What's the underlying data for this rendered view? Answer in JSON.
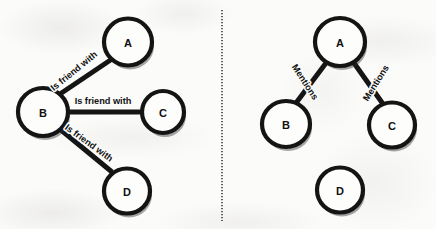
{
  "diagram": {
    "background_color": "#fbfbfa",
    "node_fill_color": "#fdfdfc",
    "stroke_color": "#141414",
    "divider": {
      "name": "panel-divider",
      "style": "vertical-dotted",
      "x": 222,
      "y_start": 10,
      "y_end": 221
    },
    "panels": [
      {
        "id": "left",
        "name": "friendship-graph",
        "edge_label_text": "Is friend with",
        "nodes": [
          {
            "id": "A",
            "label": "A",
            "cx": 128,
            "cy": 42,
            "r": 24
          },
          {
            "id": "B",
            "label": "B",
            "cx": 43,
            "cy": 112,
            "r": 25
          },
          {
            "id": "C",
            "label": "C",
            "cx": 163,
            "cy": 112,
            "r": 21
          },
          {
            "id": "D",
            "label": "D",
            "cx": 127,
            "cy": 191,
            "r": 23
          }
        ],
        "edges": [
          {
            "from": "B",
            "to": "A",
            "label": "Is friend with",
            "label_x": 74,
            "label_y": 71,
            "label_rotation": -39
          },
          {
            "from": "B",
            "to": "C",
            "label": "Is friend with",
            "label_x": 103,
            "label_y": 101,
            "label_rotation": 0
          },
          {
            "from": "B",
            "to": "D",
            "label": "Is friend with",
            "label_x": 89,
            "label_y": 143,
            "label_rotation": 36
          }
        ]
      },
      {
        "id": "right",
        "name": "mentions-graph",
        "edge_label_text": "Mentions",
        "nodes": [
          {
            "id": "A",
            "label": "A",
            "cx": 340,
            "cy": 42,
            "r": 25
          },
          {
            "id": "B",
            "label": "B",
            "cx": 286,
            "cy": 124,
            "r": 24
          },
          {
            "id": "C",
            "label": "C",
            "cx": 392,
            "cy": 125,
            "r": 23
          },
          {
            "id": "D",
            "label": "D",
            "cx": 340,
            "cy": 190,
            "r": 23
          }
        ],
        "edges": [
          {
            "from": "A",
            "to": "B",
            "label": "Mentions",
            "label_x": 305,
            "label_y": 82,
            "label_rotation": 57
          },
          {
            "from": "A",
            "to": "C",
            "label": "Mentions",
            "label_x": 376,
            "label_y": 83,
            "label_rotation": -58
          }
        ]
      }
    ]
  }
}
